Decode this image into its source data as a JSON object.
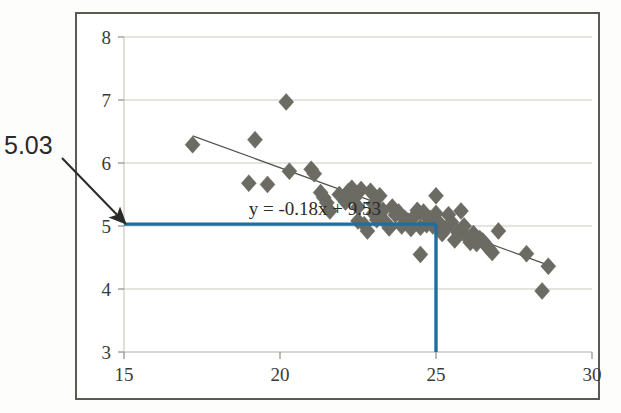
{
  "figure": {
    "background_color": "#ffffff",
    "frame_color": "#5a5a52",
    "marker_color": "#6b6b63",
    "trendline_color": "#555550",
    "highlight_color": "#1f6e9c",
    "gridline_color": "#c9c9c2"
  },
  "annotation": {
    "value_label": "5.03",
    "arrow_from": [
      62,
      158
    ],
    "arrow_to": [
      124,
      222
    ],
    "description": "arrow pointing to predicted y value 5.03 on the y-axis"
  },
  "chart_data": {
    "type": "scatter",
    "title": "",
    "xlabel": "",
    "ylabel": "",
    "xlim": [
      15,
      30
    ],
    "ylim": [
      3,
      8
    ],
    "xticks": [
      15,
      20,
      25,
      30
    ],
    "yticks": [
      3,
      4,
      5,
      6,
      7,
      8
    ],
    "xtick_labels": [
      "15",
      "20",
      "25",
      "30"
    ],
    "ytick_labels": [
      "3",
      "4",
      "5",
      "6",
      "7",
      "8"
    ],
    "grid": "horizontal",
    "legend": "none",
    "marker": "diamond",
    "annotations": [
      {
        "text": "y = -0.18x + 9.53",
        "x": 19.0,
        "y": 5.18,
        "kind": "equation"
      },
      {
        "text": "5.03",
        "x": 15.0,
        "y": 5.03,
        "kind": "callout"
      }
    ],
    "trendline": {
      "equation": "y = -0.18x + 9.53",
      "slope": -0.18,
      "intercept": 9.53,
      "x_start": 17.2,
      "x_end": 28.6,
      "y_start": 6.43,
      "y_end": 4.38
    },
    "highlight_lines": {
      "horizontal": {
        "y": 5.03,
        "x_from": 15.0,
        "x_to": 25.0
      },
      "vertical": {
        "x": 25.0,
        "y_from": 3.0,
        "y_to": 5.03
      }
    },
    "x": [
      17.2,
      19.0,
      19.2,
      19.6,
      20.2,
      20.3,
      21.0,
      21.1,
      21.3,
      21.4,
      21.5,
      21.6,
      21.9,
      22.1,
      22.2,
      22.3,
      22.4,
      22.5,
      22.5,
      22.6,
      22.7,
      22.8,
      22.9,
      23.0,
      23.0,
      23.1,
      23.2,
      23.3,
      23.4,
      23.5,
      23.6,
      23.7,
      23.8,
      23.9,
      24.0,
      24.1,
      24.2,
      24.3,
      24.4,
      24.5,
      24.5,
      24.6,
      24.7,
      24.8,
      24.9,
      25.0,
      25.0,
      25.1,
      25.2,
      25.3,
      25.4,
      25.5,
      25.6,
      25.7,
      25.8,
      25.9,
      26.0,
      26.1,
      26.2,
      26.3,
      26.4,
      26.5,
      26.6,
      26.7,
      26.8,
      27.0,
      27.9,
      28.4,
      28.6
    ],
    "y": [
      6.29,
      5.68,
      6.37,
      5.66,
      6.97,
      5.87,
      5.9,
      5.83,
      5.53,
      5.45,
      5.37,
      5.24,
      5.5,
      5.38,
      5.55,
      5.6,
      5.45,
      5.3,
      5.08,
      5.58,
      5.02,
      4.92,
      5.55,
      5.35,
      5.2,
      5.1,
      5.48,
      5.25,
      5.05,
      4.97,
      5.3,
      5.18,
      5.22,
      5.0,
      5.12,
      5.08,
      4.96,
      5.15,
      5.25,
      4.55,
      4.98,
      5.22,
      5.02,
      5.12,
      5.0,
      5.48,
      5.2,
      5.05,
      4.88,
      4.95,
      5.18,
      5.06,
      4.78,
      4.9,
      5.24,
      5.0,
      4.82,
      4.74,
      4.88,
      4.72,
      4.8,
      4.76,
      4.7,
      4.64,
      4.58,
      4.92,
      4.56,
      3.97,
      4.36
    ]
  }
}
